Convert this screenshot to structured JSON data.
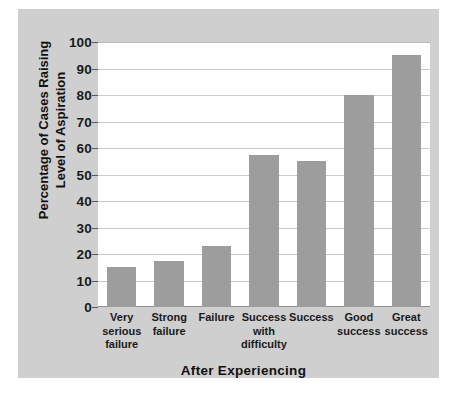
{
  "chart_data": {
    "type": "bar",
    "title": "",
    "subtitle": "",
    "xlabel": "After Experiencing",
    "ylabel": "Percentage of Cases Raising\nLevel of Aspiration",
    "ylabel_lines": [
      "Percentage of Cases Raising",
      "Level of Aspiration"
    ],
    "categories": [
      "Very\nserious\nfailure",
      "Strong\nfailure",
      "Failure",
      "Success\nwith\ndifficulty",
      "Success",
      "Good\nsuccess",
      "Great\nsuccess"
    ],
    "category_labels_flat": [
      "Very serious failure",
      "Strong failure",
      "Failure",
      "Success with difficulty",
      "Success",
      "Good success",
      "Great success"
    ],
    "values": [
      15,
      17.5,
      23,
      57.5,
      55,
      80,
      95
    ],
    "ylim": [
      0,
      100
    ],
    "yticks": [
      0,
      10,
      20,
      30,
      40,
      50,
      60,
      70,
      80,
      90,
      100
    ],
    "ytick_labels": [
      "0",
      "10",
      "20",
      "30",
      "40",
      "50",
      "60",
      "70",
      "80",
      "90",
      "100"
    ],
    "grid": true,
    "grid_axis": "y",
    "legend": null,
    "legend_position": "none",
    "bar_color": "#9d9d9d",
    "plot_background": "#ffffff",
    "figure_background": "#cfcfcf",
    "gridline_color": "#c9c9c9",
    "text_color": "#111111"
  }
}
